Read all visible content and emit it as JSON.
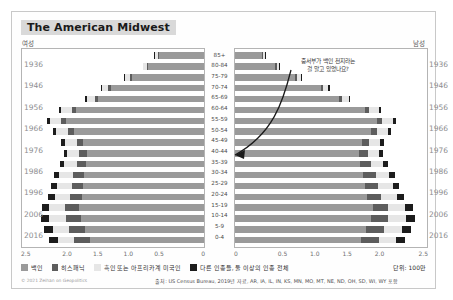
{
  "header": {
    "title": "The American Midwest",
    "female_label": "여성",
    "male_label": "남성"
  },
  "annotation": {
    "line1": "중서부가 백인 천지라는",
    "line2": "걸 알고 있었나요?"
  },
  "legend": {
    "items": [
      {
        "label": "백인",
        "color": "#9a9a9a"
      },
      {
        "label": "히스패닉",
        "color": "#5d5d5d"
      },
      {
        "label": "흑인 또는 아프리카계 미국인",
        "color": "#e6e6e6"
      },
      {
        "label": "다른 인종들, 둘 이상의 인종 전체",
        "color": "#1c1c1c"
      }
    ],
    "unit": "단위: 100만"
  },
  "footer": {
    "credit": "© 2021 Zeihan on Geopolitics",
    "source": "출처: US Census Bureau, 2019년 자료, AR, IA, IL, IN, KS, MN, MO, MT, NE, ND, OH, SD, WI, WY 포함"
  },
  "chart_data": {
    "type": "bar",
    "title": "The American Midwest",
    "subtype": "population-pyramid",
    "xlabel": "",
    "ylabel": "",
    "unit": "millions",
    "xlim": [
      0,
      2.5
    ],
    "grid": false,
    "legend_position": "bottom",
    "age_groups": [
      "85+",
      "80-84",
      "75-79",
      "70-74",
      "65-69",
      "60-64",
      "55-59",
      "50-54",
      "45-49",
      "40-44",
      "35-39",
      "30-34",
      "25-29",
      "20-24",
      "15-19",
      "10-14",
      "5-9",
      "0-4"
    ],
    "birth_years": [
      "1936",
      "1946",
      "1956",
      "1966",
      "1976",
      "1986",
      "1996",
      "2006",
      "2016"
    ],
    "ticks_left": [
      "2.5",
      "2.0",
      "1.5",
      "1.0",
      "0.5",
      "0"
    ],
    "ticks_right": [
      "0",
      "0.5",
      "1.0",
      "1.5",
      "2.0",
      "2.5"
    ],
    "series_names": [
      "백인",
      "히스패닉",
      "흑인 또는 아프리카계 미국인",
      "다른 인종들, 둘 이상의 인종 전체"
    ],
    "female": {
      "white": [
        0.62,
        0.77,
        0.99,
        1.28,
        1.46,
        1.77,
        1.9,
        1.8,
        1.67,
        1.62,
        1.63,
        1.66,
        1.67,
        1.68,
        1.73,
        1.7,
        1.64,
        1.58
      ],
      "hisp": [
        0.02,
        0.02,
        0.03,
        0.04,
        0.05,
        0.06,
        0.07,
        0.08,
        0.09,
        0.11,
        0.13,
        0.15,
        0.16,
        0.17,
        0.19,
        0.21,
        0.22,
        0.22
      ],
      "black": [
        0.04,
        0.05,
        0.07,
        0.09,
        0.11,
        0.14,
        0.16,
        0.16,
        0.16,
        0.16,
        0.17,
        0.19,
        0.2,
        0.21,
        0.22,
        0.23,
        0.23,
        0.22
      ],
      "other": [
        0.01,
        0.01,
        0.02,
        0.02,
        0.03,
        0.03,
        0.04,
        0.04,
        0.05,
        0.05,
        0.06,
        0.07,
        0.08,
        0.09,
        0.1,
        0.11,
        0.12,
        0.12
      ]
    },
    "male": {
      "white": [
        0.36,
        0.53,
        0.79,
        1.12,
        1.36,
        1.7,
        1.86,
        1.78,
        1.66,
        1.62,
        1.64,
        1.68,
        1.7,
        1.73,
        1.8,
        1.78,
        1.72,
        1.65
      ],
      "hisp": [
        0.01,
        0.02,
        0.02,
        0.03,
        0.04,
        0.06,
        0.07,
        0.08,
        0.1,
        0.12,
        0.14,
        0.16,
        0.17,
        0.18,
        0.2,
        0.22,
        0.23,
        0.23
      ],
      "black": [
        0.02,
        0.03,
        0.05,
        0.07,
        0.09,
        0.12,
        0.14,
        0.14,
        0.14,
        0.15,
        0.16,
        0.18,
        0.2,
        0.21,
        0.23,
        0.24,
        0.24,
        0.23
      ],
      "other": [
        0.01,
        0.01,
        0.01,
        0.02,
        0.02,
        0.03,
        0.04,
        0.04,
        0.05,
        0.05,
        0.06,
        0.07,
        0.08,
        0.09,
        0.1,
        0.11,
        0.12,
        0.12
      ]
    }
  }
}
